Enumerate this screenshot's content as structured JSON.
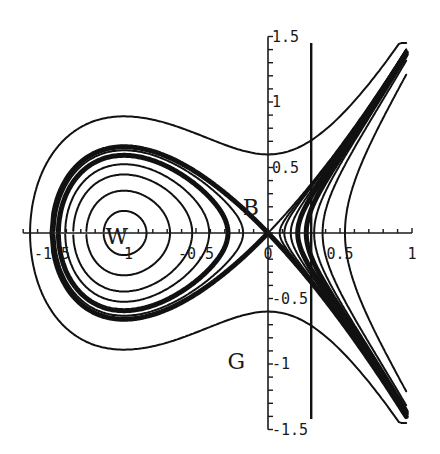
{
  "figure": {
    "x_axis": {
      "range": [
        -1.7,
        1.0
      ],
      "tick_labels": [
        {
          "value": -1.5,
          "text": "-1.5"
        },
        {
          "value": -1,
          "text": "-1"
        },
        {
          "value": -0.5,
          "text": "-0.5"
        },
        {
          "value": 0,
          "text": "0"
        },
        {
          "value": 0.5,
          "text": "0.5"
        },
        {
          "value": 1,
          "text": "1"
        }
      ],
      "minor_step": 0.1
    },
    "y_axis": {
      "range": [
        -1.5,
        1.5
      ],
      "tick_labels": [
        {
          "value": 1.5,
          "text": "1.5"
        },
        {
          "value": 1,
          "text": "1"
        },
        {
          "value": 0.5,
          "text": "0.5"
        },
        {
          "value": -0.5,
          "text": "-0.5"
        },
        {
          "value": -1,
          "text": "-1"
        },
        {
          "value": -1.5,
          "text": "-1.5"
        }
      ],
      "minor_step": 0.1
    },
    "vertical_line_x": 0.3,
    "point_labels": [
      {
        "text": "W",
        "x": -1.05,
        "y": -0.02
      },
      {
        "text": "B",
        "x": -0.12,
        "y": 0.2
      },
      {
        "text": "G",
        "x": -0.22,
        "y": -0.98
      }
    ],
    "closed_orbit_energies": [
      -0.22,
      -0.18,
      -0.13,
      -0.09,
      -0.05,
      -0.025
    ],
    "separatrix_energy": 0,
    "outer_orbit_energy": 0.18,
    "right_branch_energies": [
      0.005,
      0.01,
      0.02,
      0.035,
      0.06,
      0.09,
      0.13,
      0.28
    ]
  }
}
